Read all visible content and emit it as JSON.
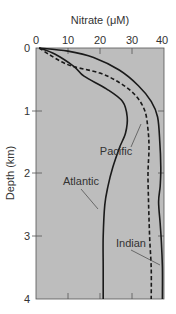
{
  "chart_data": {
    "type": "line",
    "title": "",
    "xlabel": "Nitrate (μM)",
    "ylabel": "Depth (km)",
    "xlim": [
      0,
      40
    ],
    "ylim": [
      4,
      0
    ],
    "x_axis_position": "top",
    "y_inverted": true,
    "xticks": [
      "0",
      "10",
      "20",
      "30",
      "40"
    ],
    "yticks": [
      "0",
      "1",
      "2",
      "3",
      "4"
    ],
    "grid": false,
    "legend": "inline labels",
    "series": [
      {
        "name": "Atlantic",
        "style": "solid",
        "points": [
          [
            1,
            0
          ],
          [
            6,
            0.1
          ],
          [
            12,
            0.3
          ],
          [
            15,
            0.45
          ],
          [
            22,
            0.65
          ],
          [
            27,
            0.85
          ],
          [
            28.5,
            1.1
          ],
          [
            28,
            1.35
          ],
          [
            26,
            1.6
          ],
          [
            24,
            1.9
          ],
          [
            22.5,
            2.2
          ],
          [
            21.5,
            2.5
          ],
          [
            21,
            3
          ],
          [
            21,
            3.5
          ],
          [
            21,
            4
          ]
        ]
      },
      {
        "name": "Pacific",
        "style": "dashed",
        "points": [
          [
            1,
            0
          ],
          [
            4,
            0.1
          ],
          [
            8,
            0.22
          ],
          [
            12,
            0.3
          ],
          [
            20,
            0.4
          ],
          [
            26,
            0.55
          ],
          [
            31,
            0.75
          ],
          [
            34,
            1.0
          ],
          [
            35,
            1.3
          ],
          [
            35.3,
            1.6
          ],
          [
            35,
            2.0
          ],
          [
            35.2,
            2.5
          ],
          [
            35.5,
            3.0
          ],
          [
            36,
            3.5
          ],
          [
            36,
            4
          ]
        ]
      },
      {
        "name": "Indian",
        "style": "solid",
        "points": [
          [
            1,
            0
          ],
          [
            10,
            0.05
          ],
          [
            18,
            0.15
          ],
          [
            26,
            0.35
          ],
          [
            32,
            0.6
          ],
          [
            36,
            0.85
          ],
          [
            38,
            1.1
          ],
          [
            38.7,
            1.5
          ],
          [
            39,
            1.9
          ],
          [
            38.8,
            2.2
          ],
          [
            38.3,
            2.45
          ],
          [
            38.8,
            2.8
          ],
          [
            39.2,
            3.1
          ],
          [
            39.5,
            3.5
          ],
          [
            39.5,
            4
          ]
        ]
      }
    ],
    "annotations": [
      {
        "text": "Pacific"
      },
      {
        "text": "Atlantic"
      },
      {
        "text": "Indian"
      }
    ]
  }
}
